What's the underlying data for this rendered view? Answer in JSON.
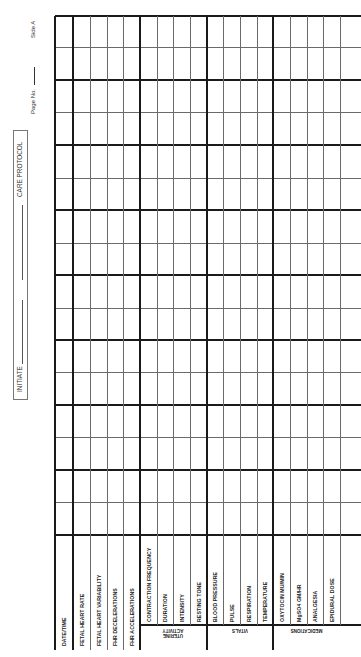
{
  "form": {
    "orientation": "rotated-90-ccw",
    "title": "CARE PROTOCOL",
    "initiate_label": "INITIATE",
    "page_label": "Page No.",
    "side_label": "Side A"
  },
  "columns": [
    {
      "label": "DATE/TIME",
      "group": null
    },
    {
      "label": "FETAL HEART RATE",
      "group": null
    },
    {
      "label": "FETAL HEART VARIABILITY",
      "group": null
    },
    {
      "label": "FHR DECELERATIONS",
      "group": null
    },
    {
      "label": "FHR ACCELERATIONS",
      "group": null
    },
    {
      "label": "CONTRACTION FREQUENCY",
      "group": "UTERINE ACTIVITY"
    },
    {
      "label": "DURATION",
      "group": "UTERINE ACTIVITY"
    },
    {
      "label": "INTENSITY",
      "group": "UTERINE ACTIVITY"
    },
    {
      "label": "RESTING TONE",
      "group": "UTERINE ACTIVITY"
    },
    {
      "label": "BLOOD PRESSURE",
      "group": "VITALS"
    },
    {
      "label": "PULSE",
      "group": "VITALS"
    },
    {
      "label": "RESPIRATION",
      "group": "VITALS"
    },
    {
      "label": "TEMPERATURE",
      "group": "VITALS"
    },
    {
      "label": "OXYTOCIN MU/MIN",
      "group": "MEDICATIONS"
    },
    {
      "label": "MgSO4 GM/HR",
      "group": "MEDICATIONS"
    },
    {
      "label": "ANALGESIA",
      "group": "MEDICATIONS"
    },
    {
      "label": "EPIDURAL DOSE",
      "group": "MEDICATIONS"
    },
    {
      "label": "",
      "group": null
    }
  ],
  "groups": [
    {
      "label": "UTERINE ACTIVITY"
    },
    {
      "label": "VITALS"
    },
    {
      "label": "MEDICATIONS"
    }
  ],
  "entry_rows": 16,
  "colors": {
    "ink": "#1a1a1a",
    "thin_line": "#6a6a6a",
    "paper": "#ffffff"
  }
}
